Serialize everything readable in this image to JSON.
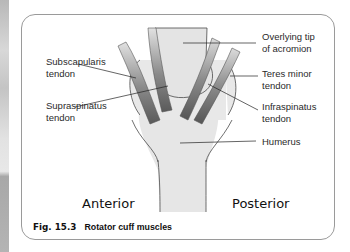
{
  "figure": {
    "number": "Fig. 15.3",
    "title": "Rotator cuff muscles"
  },
  "orientation": {
    "left": "Anterior",
    "right": "Posterior"
  },
  "labels": {
    "subscapularis": "Subscapularis\ntendon",
    "supraspinatus": "Supraspinatus\ntendon",
    "acromion": "Overlying tip\nof acromion",
    "teres_minor": "Teres minor\ntendon",
    "infraspinatus": "Infraspinatus\ntendon",
    "humerus": "Humerus"
  },
  "colors": {
    "tendon_dark": "#5e5e5e",
    "tendon_light": "#d8d8d8",
    "bone": "#e6e6e6",
    "outline": "#4a4a4a"
  }
}
